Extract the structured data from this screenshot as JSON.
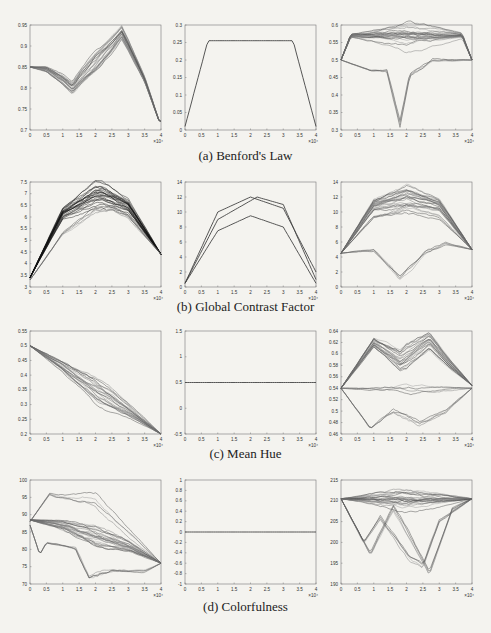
{
  "figure": {
    "captions": [
      "(a) Benford's Law",
      "(b) Global Contrast Factor",
      "(c) Mean Hue",
      "(d) Colorfulness"
    ]
  },
  "chart_data": [
    {
      "type": "line",
      "row": 0,
      "col": 0,
      "title": "",
      "group": "(a) Benford's Law",
      "xlabel": "",
      "ylabel": "",
      "x_multiplier": "×10^4",
      "xlim": [
        0,
        4
      ],
      "ylim": [
        0.7,
        0.95
      ],
      "xticks": [
        "0",
        "0.5",
        "1",
        "1.5",
        "2",
        "2.5",
        "3",
        "3.5",
        "4"
      ],
      "yticks": [
        "0.7",
        "0.75",
        "0.8",
        "0.85",
        "0.9",
        "0.95"
      ],
      "series": [
        {
          "name": "trajectories (many, gray)",
          "x": [
            0,
            0.5,
            1,
            1.3,
            1.5,
            2,
            2.5,
            2.8,
            3,
            3.5,
            3.95
          ],
          "values": [
            0.85,
            0.845,
            0.82,
            0.8,
            0.82,
            0.86,
            0.9,
            0.93,
            0.9,
            0.82,
            0.72
          ]
        }
      ]
    },
    {
      "type": "line",
      "row": 0,
      "col": 1,
      "title": "",
      "group": "(a) Benford's Law",
      "xlim": [
        0,
        4
      ],
      "ylim": [
        0,
        0.3
      ],
      "x_multiplier": "×10^4",
      "xticks": [
        "0",
        "0.5",
        "1",
        "1.5",
        "2",
        "2.5",
        "3",
        "3.5",
        "4"
      ],
      "yticks": [
        "0",
        "0.05",
        "0.1",
        "0.15",
        "0.2",
        "0.25",
        "0.3"
      ],
      "series": [
        {
          "name": "trajectory",
          "x": [
            0,
            0.7,
            3.3,
            4
          ],
          "values": [
            0.01,
            0.255,
            0.255,
            0.01
          ]
        }
      ]
    },
    {
      "type": "line",
      "row": 0,
      "col": 2,
      "title": "",
      "group": "(a) Benford's Law",
      "xlim": [
        0,
        4
      ],
      "ylim": [
        0.3,
        0.6
      ],
      "x_multiplier": "×10^4",
      "xticks": [
        "0",
        "0.5",
        "1",
        "1.5",
        "2",
        "2.5",
        "3",
        "3.5",
        "4"
      ],
      "yticks": [
        "0.3",
        "0.35",
        "0.4",
        "0.45",
        "0.5",
        "0.55",
        "0.6"
      ],
      "series": [
        {
          "name": "band upper",
          "x": [
            0,
            0.3,
            3.7,
            4
          ],
          "values": [
            0.5,
            0.57,
            0.57,
            0.5
          ]
        },
        {
          "name": "dip trajectory",
          "x": [
            0,
            0.9,
            1.4,
            1.8,
            2.1,
            2.5,
            2.8,
            4
          ],
          "values": [
            0.5,
            0.47,
            0.47,
            0.32,
            0.46,
            0.48,
            0.5,
            0.5
          ]
        }
      ]
    },
    {
      "type": "line",
      "row": 1,
      "col": 0,
      "title": "",
      "group": "(b) Global Contrast Factor",
      "xlim": [
        0,
        4
      ],
      "ylim": [
        3,
        7.5
      ],
      "x_multiplier": "×10^4",
      "xticks": [
        "0",
        "0.5",
        "1",
        "1.5",
        "2",
        "2.5",
        "3",
        "3.5",
        "4"
      ],
      "yticks": [
        "3",
        "3.5",
        "4",
        "4.5",
        "5",
        "5.5",
        "6",
        "6.5",
        "7",
        "7.5"
      ],
      "series": [
        {
          "name": "upper envelope (black)",
          "x": [
            0,
            1,
            2,
            2.2,
            3,
            4
          ],
          "values": [
            3.4,
            6.2,
            7.05,
            7.05,
            6.5,
            4.4
          ]
        },
        {
          "name": "bundle",
          "x": [
            0,
            1,
            2,
            2.5,
            3,
            4
          ],
          "values": [
            3.3,
            5.3,
            6.3,
            6.4,
            6.0,
            4.4
          ]
        }
      ]
    },
    {
      "type": "line",
      "row": 1,
      "col": 1,
      "title": "",
      "group": "(b) Global Contrast Factor",
      "xlim": [
        0,
        4
      ],
      "ylim": [
        0,
        14
      ],
      "x_multiplier": "×10^4",
      "xticks": [
        "0",
        "0.5",
        "1",
        "1.5",
        "2",
        "2.5",
        "3",
        "3.5",
        "4"
      ],
      "yticks": [
        "0",
        "2",
        "4",
        "6",
        "8",
        "10",
        "12",
        "14"
      ],
      "series": [
        {
          "name": "upper (light)",
          "x": [
            0,
            1,
            2,
            3,
            4
          ],
          "values": [
            0.5,
            10,
            12,
            10.5,
            2
          ]
        },
        {
          "name": "black arc",
          "x": [
            0,
            1,
            2.2,
            3,
            4
          ],
          "values": [
            0.5,
            9,
            12,
            11,
            1
          ]
        },
        {
          "name": "bundle",
          "x": [
            0,
            1,
            2,
            3,
            4
          ],
          "values": [
            0.5,
            7.5,
            9.5,
            8,
            0.5
          ]
        }
      ]
    },
    {
      "type": "line",
      "row": 1,
      "col": 2,
      "title": "",
      "group": "(b) Global Contrast Factor",
      "xlim": [
        0,
        4
      ],
      "ylim": [
        0,
        14
      ],
      "x_multiplier": "×10^4",
      "xticks": [
        "0",
        "0.5",
        "1",
        "1.5",
        "2",
        "2.5",
        "3",
        "3.5",
        "4"
      ],
      "yticks": [
        "0",
        "2",
        "4",
        "6",
        "8",
        "10",
        "12",
        "14"
      ],
      "series": [
        {
          "name": "top arc",
          "x": [
            0,
            1,
            2,
            3,
            4
          ],
          "values": [
            4.5,
            11,
            12.2,
            11,
            5
          ]
        },
        {
          "name": "gray arc",
          "x": [
            0,
            1,
            2,
            3,
            4
          ],
          "values": [
            4.5,
            9.5,
            10.5,
            9.5,
            5
          ]
        },
        {
          "name": "dip",
          "x": [
            0,
            1,
            1.8,
            2.6,
            3.2,
            4
          ],
          "values": [
            4.5,
            5,
            1.5,
            5,
            6,
            5
          ]
        }
      ]
    },
    {
      "type": "line",
      "row": 2,
      "col": 0,
      "title": "",
      "group": "(c) Mean Hue",
      "xlim": [
        0,
        4
      ],
      "ylim": [
        0.2,
        0.55
      ],
      "x_multiplier": "×10^4",
      "xticks": [
        "0",
        "0.5",
        "1",
        "1.5",
        "2",
        "2.5",
        "3",
        "3.5",
        "4"
      ],
      "yticks": [
        "0.2",
        "0.25",
        "0.3",
        "0.35",
        "0.4",
        "0.45",
        "0.5",
        "0.55"
      ],
      "series": [
        {
          "name": "bundle",
          "x": [
            0,
            1,
            2,
            3,
            4
          ],
          "values": [
            0.5,
            0.43,
            0.35,
            0.28,
            0.2
          ]
        }
      ]
    },
    {
      "type": "line",
      "row": 2,
      "col": 1,
      "title": "",
      "group": "(c) Mean Hue",
      "xlim": [
        0,
        4
      ],
      "ylim": [
        -0.5,
        1.5
      ],
      "x_multiplier": "×10^4",
      "xticks": [
        "0",
        "0.5",
        "1",
        "1.5",
        "2",
        "2.5",
        "3",
        "3.5",
        "4"
      ],
      "yticks": [
        "-0.5",
        "0",
        "0.5",
        "1",
        "1.5"
      ],
      "series": [
        {
          "name": "constant",
          "x": [
            0,
            4
          ],
          "values": [
            0.5,
            0.5
          ]
        }
      ]
    },
    {
      "type": "line",
      "row": 2,
      "col": 2,
      "title": "",
      "group": "(c) Mean Hue",
      "xlim": [
        0,
        4
      ],
      "ylim": [
        0.46,
        0.64
      ],
      "x_multiplier": "×10^4",
      "xticks": [
        "0",
        "0.5",
        "1",
        "1.5",
        "2",
        "2.5",
        "3",
        "3.5",
        "4"
      ],
      "yticks": [
        "0.46",
        "0.48",
        "0.5",
        "0.52",
        "0.54",
        "0.56",
        "0.58",
        "0.6",
        "0.62",
        "0.64"
      ],
      "series": [
        {
          "name": "high",
          "x": [
            0,
            1,
            1.8,
            2.7,
            3.3,
            4
          ],
          "values": [
            0.54,
            0.62,
            0.59,
            0.625,
            0.585,
            0.545
          ]
        },
        {
          "name": "low",
          "x": [
            0,
            0.9,
            1.6,
            2.4,
            3.2,
            4
          ],
          "values": [
            0.54,
            0.47,
            0.5,
            0.48,
            0.5,
            0.54
          ]
        },
        {
          "name": "mean",
          "x": [
            0,
            4
          ],
          "values": [
            0.54,
            0.54
          ]
        }
      ]
    },
    {
      "type": "line",
      "row": 3,
      "col": 0,
      "title": "",
      "group": "(d) Colorfulness",
      "xlim": [
        0,
        4
      ],
      "ylim": [
        70,
        100
      ],
      "x_multiplier": "×10^4",
      "xticks": [
        "0",
        "0.5",
        "1",
        "1.5",
        "2",
        "2.5",
        "3",
        "3.5",
        "4"
      ],
      "yticks": [
        "70",
        "75",
        "80",
        "85",
        "90",
        "95",
        "100"
      ],
      "series": [
        {
          "name": "bundle",
          "x": [
            0,
            1,
            2,
            3,
            4
          ],
          "values": [
            88.5,
            87,
            84,
            81,
            76
          ]
        },
        {
          "name": "high outlier",
          "x": [
            0,
            0.6,
            0.8,
            1.5,
            1.6,
            2,
            4
          ],
          "values": [
            88,
            96,
            95.5,
            95,
            95.5,
            95,
            76
          ]
        },
        {
          "name": "low outlier",
          "x": [
            0,
            0.3,
            0.5,
            1.4,
            1.8,
            2.5,
            3.5,
            4
          ],
          "values": [
            87,
            78.5,
            82,
            81,
            73,
            75,
            74,
            76
          ]
        }
      ]
    },
    {
      "type": "line",
      "row": 3,
      "col": 1,
      "title": "",
      "group": "(d) Colorfulness",
      "xlim": [
        0,
        4
      ],
      "ylim": [
        -1,
        1
      ],
      "x_multiplier": "×10^4",
      "xticks": [
        "0",
        "0.5",
        "1",
        "1.5",
        "2",
        "2.5",
        "3",
        "3.5",
        "4"
      ],
      "yticks": [
        "-1",
        "-0.8",
        "-0.6",
        "-0.4",
        "-0.2",
        "0",
        "0.2",
        "0.4",
        "0.6",
        "0.8",
        "1"
      ],
      "series": [
        {
          "name": "constant",
          "x": [
            0,
            4
          ],
          "values": [
            0,
            0
          ]
        }
      ]
    },
    {
      "type": "line",
      "row": 3,
      "col": 2,
      "title": "",
      "group": "(d) Colorfulness",
      "xlim": [
        0,
        4
      ],
      "ylim": [
        190,
        215
      ],
      "x_multiplier": "×10^4",
      "xticks": [
        "0",
        "0.5",
        "1",
        "1.5",
        "2",
        "2.5",
        "3",
        "3.5",
        "4"
      ],
      "yticks": [
        "190",
        "195",
        "200",
        "205",
        "210",
        "215"
      ],
      "series": [
        {
          "name": "top",
          "x": [
            0,
            4
          ],
          "values": [
            210.5,
            210.5
          ]
        },
        {
          "name": "dip a",
          "x": [
            0,
            0.9,
            1.6,
            2.2,
            2.7,
            3.4,
            4
          ],
          "values": [
            210.5,
            197,
            208,
            200,
            192.5,
            208,
            210.5
          ]
        },
        {
          "name": "dip b",
          "x": [
            0,
            0.7,
            1.2,
            2.1,
            2.5,
            3,
            4
          ],
          "values": [
            210.5,
            200,
            206,
            196,
            194,
            205,
            210.5
          ]
        }
      ]
    }
  ]
}
